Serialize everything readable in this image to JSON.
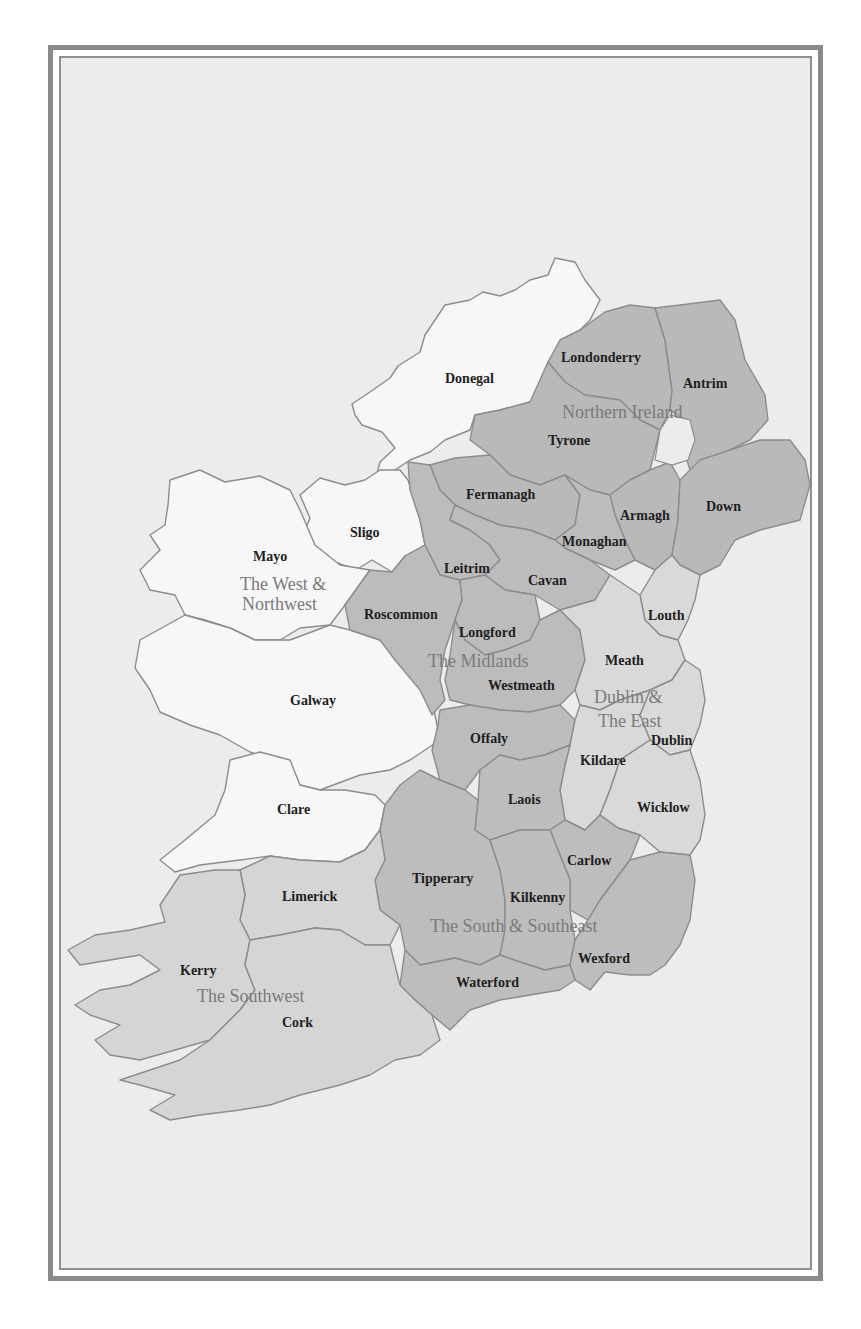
{
  "map": {
    "title": "Regions and Counties of Ireland",
    "colors": {
      "background": "#ececec",
      "frame": "#8a8a8a",
      "west_northwest": "#f7f7f7",
      "northern_ireland": "#b9b9b9",
      "midlands": "#bcbcbc",
      "dublin_east": "#d9d9d9",
      "south_southeast": "#bdbdbd",
      "southwest": "#d5d5d5",
      "county_border": "#8c8c8c",
      "county_label": "#1e1e1e",
      "region_label": "#7a7a7a"
    },
    "regions": [
      {
        "name": "Northern Ireland",
        "counties": [
          "Londonderry",
          "Antrim",
          "Tyrone",
          "Fermanagh",
          "Armagh",
          "Down"
        ]
      },
      {
        "name": "The West & Northwest",
        "counties": [
          "Donegal",
          "Sligo",
          "Mayo",
          "Galway",
          "Clare"
        ]
      },
      {
        "name": "The Midlands",
        "counties": [
          "Leitrim",
          "Roscommon",
          "Longford",
          "Westmeath",
          "Offaly",
          "Cavan",
          "Monaghan"
        ]
      },
      {
        "name": "Dublin & The East",
        "counties": [
          "Louth",
          "Meath",
          "Dublin",
          "Kildare",
          "Wicklow"
        ]
      },
      {
        "name": "The South & Southeast",
        "counties": [
          "Laois",
          "Carlow",
          "Tipperary",
          "Kilkenny",
          "Wexford",
          "Waterford"
        ]
      },
      {
        "name": "The Southwest",
        "counties": [
          "Limerick",
          "Kerry",
          "Cork"
        ]
      }
    ],
    "region_labels": {
      "ni": "Northern Ireland",
      "wnw_1": "The West &",
      "wnw_2": "Northwest",
      "mid": "The Midlands",
      "de_1": "Dublin &",
      "de_2": "The East",
      "sse": "The South & Southeast",
      "sw": "The Southwest"
    },
    "county_labels": {
      "donegal": "Donegal",
      "londonderry": "Londonderry",
      "antrim": "Antrim",
      "tyrone": "Tyrone",
      "fermanagh": "Fermanagh",
      "armagh": "Armagh",
      "down": "Down",
      "sligo": "Sligo",
      "mayo": "Mayo",
      "monaghan": "Monaghan",
      "leitrim": "Leitrim",
      "cavan": "Cavan",
      "roscommon": "Roscommon",
      "louth": "Louth",
      "longford": "Longford",
      "meath": "Meath",
      "westmeath": "Westmeath",
      "galway": "Galway",
      "offaly": "Offaly",
      "dublin": "Dublin",
      "kildare": "Kildare",
      "laois": "Laois",
      "wicklow": "Wicklow",
      "clare": "Clare",
      "carlow": "Carlow",
      "tipperary": "Tipperary",
      "limerick": "Limerick",
      "kilkenny": "Kilkenny",
      "wexford": "Wexford",
      "kerry": "Kerry",
      "waterford": "Waterford",
      "cork": "Cork"
    }
  }
}
